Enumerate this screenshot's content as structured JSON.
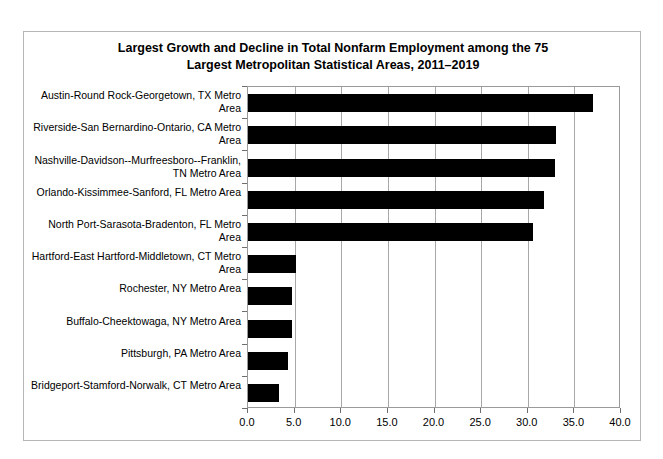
{
  "chart_data": {
    "type": "bar",
    "orientation": "horizontal",
    "title": "Largest Growth and Decline in Total Nonfarm Employment among the 75 Largest Metropolitan Statistical Areas, 2011–2019",
    "title_lines": [
      "Largest Growth and Decline in Total Nonfarm Employment among the 75",
      "Largest Metropolitan Statistical Areas, 2011–2019"
    ],
    "xlabel": "",
    "ylabel": "",
    "categories": [
      "Austin-Round Rock-Georgetown, TX Metro Area",
      "Riverside-San Bernardino-Ontario, CA Metro Area",
      "Nashville-Davidson--Murfreesboro--Franklin, TN Metro Area",
      "Orlando-Kissimmee-Sanford, FL Metro Area",
      "North Port-Sarasota-Bradenton, FL Metro Area",
      "Hartford-East Hartford-Middletown, CT Metro Area",
      "Rochester, NY Metro Area",
      "Buffalo-Cheektowaga, NY Metro Area",
      "Pittsburgh, PA Metro Area",
      "Bridgeport-Stamford-Norwalk, CT Metro Area"
    ],
    "values": [
      37.0,
      33.0,
      32.9,
      31.7,
      30.6,
      5.2,
      4.7,
      4.7,
      4.3,
      3.3
    ],
    "xlim": [
      0.0,
      40.0
    ],
    "xticks": [
      0.0,
      5.0,
      10.0,
      15.0,
      20.0,
      25.0,
      30.0,
      35.0,
      40.0
    ],
    "xtick_labels": [
      "0.0",
      "5.0",
      "10.0",
      "15.0",
      "20.0",
      "25.0",
      "30.0",
      "35.0",
      "40.0"
    ],
    "grid": "vertical",
    "legend": null,
    "bar_color": "#000000"
  },
  "colors": {
    "bar": "#000000",
    "grid": "#a8a8a8",
    "plot_border": "#9a9a9a",
    "figure_border": "#b6b6b6",
    "text": "#000000",
    "background": "#ffffff"
  }
}
